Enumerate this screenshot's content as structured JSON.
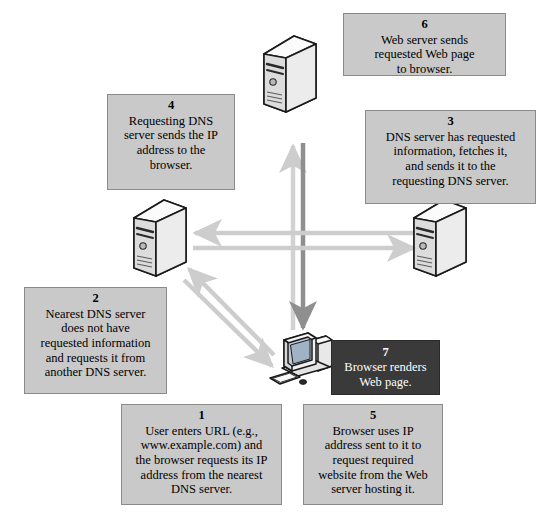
{
  "diagram": {
    "colors": {
      "box_fill": "#c9c9c9",
      "box_border": "#8a8a8a",
      "box_text": "#000000",
      "dark_box_fill": "#3a3a3a",
      "dark_box_text": "#ffffff",
      "arrow_light": "#cfcfcf",
      "arrow_mid": "#b6b6b6",
      "arrow_dark": "#8f8f8f",
      "page_background": "#ffffff"
    },
    "steps": [
      {
        "id": "step-1",
        "number": "1",
        "text": "User enters URL (e.g.,\nwww.example.com) and\nthe browser requests its IP\naddress from the nearest\nDNS server.",
        "style": "light"
      },
      {
        "id": "step-2",
        "number": "2",
        "text": "Nearest DNS server\ndoes not have\nrequested information\nand requests it from\nanother DNS server.",
        "style": "light"
      },
      {
        "id": "step-3",
        "number": "3",
        "text": "DNS server has requested\ninformation, fetches it,\nand sends it to the\nrequesting DNS server.",
        "style": "light"
      },
      {
        "id": "step-4",
        "number": "4",
        "text": "Requesting DNS\nserver sends the IP\naddress to the\nbrowser.",
        "style": "light"
      },
      {
        "id": "step-5",
        "number": "5",
        "text": "Browser uses IP\naddress sent to it to\nrequest required\nwebsite from the Web\nserver hosting it.",
        "style": "light"
      },
      {
        "id": "step-6",
        "number": "6",
        "text": "Web server sends\nrequested Web page\nto browser.",
        "style": "light"
      },
      {
        "id": "step-7",
        "number": "7",
        "text": "Browser renders\nWeb page.",
        "style": "dark"
      }
    ],
    "nodes": [
      {
        "id": "web-server",
        "label": "Web server",
        "icon": "server-tower-icon"
      },
      {
        "id": "nearest-dns-server",
        "label": "Nearest DNS server",
        "icon": "server-tower-icon"
      },
      {
        "id": "other-dns-server",
        "label": "Another DNS server",
        "icon": "server-tower-icon"
      },
      {
        "id": "user-computer",
        "label": "User computer / browser",
        "icon": "desktop-computer-icon"
      }
    ],
    "flows": [
      {
        "id": "flow-1",
        "from": "user-computer",
        "to": "nearest-dns-server",
        "tone": "light"
      },
      {
        "id": "flow-2",
        "from": "nearest-dns-server",
        "to": "other-dns-server",
        "tone": "light"
      },
      {
        "id": "flow-3",
        "from": "other-dns-server",
        "to": "nearest-dns-server",
        "tone": "light"
      },
      {
        "id": "flow-4",
        "from": "nearest-dns-server",
        "to": "user-computer",
        "tone": "light"
      },
      {
        "id": "flow-5",
        "from": "user-computer",
        "to": "web-server",
        "tone": "light"
      },
      {
        "id": "flow-6",
        "from": "web-server",
        "to": "user-computer",
        "tone": "dark"
      }
    ]
  }
}
